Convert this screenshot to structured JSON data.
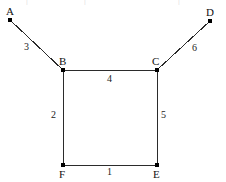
{
  "figure": {
    "width": 226,
    "height": 182,
    "background_color": "#ffffff",
    "stroke_color": "#2b2b2b",
    "node_color": "#000000",
    "label_color": "#111111"
  },
  "artifacts": {
    "top_row_marks": [
      "|",
      "|",
      "|"
    ]
  },
  "chart_data": {
    "type": "diagram",
    "subtype": "node-link-graph",
    "directed": false,
    "weighted": true,
    "nodes": [
      {
        "id": "A",
        "label": "A",
        "x": 10,
        "y": 20,
        "label_x": 6,
        "label_y": 6,
        "degree": 1
      },
      {
        "id": "B",
        "label": "B",
        "x": 63,
        "y": 70,
        "label_x": 59,
        "label_y": 56,
        "degree": 3
      },
      {
        "id": "C",
        "label": "C",
        "x": 157,
        "y": 70,
        "label_x": 152,
        "label_y": 56,
        "degree": 3
      },
      {
        "id": "D",
        "label": "D",
        "x": 210,
        "y": 21,
        "label_x": 206,
        "label_y": 7,
        "degree": 1
      },
      {
        "id": "E",
        "label": "E",
        "x": 157,
        "y": 165,
        "label_x": 153,
        "label_y": 169,
        "degree": 2
      },
      {
        "id": "F",
        "label": "F",
        "x": 63,
        "y": 165,
        "label_x": 59,
        "label_y": 169,
        "degree": 2
      }
    ],
    "edges": [
      {
        "id": "AB",
        "source": "A",
        "target": "B",
        "weight": 3,
        "label": "3",
        "label_x": 24,
        "label_y": 42
      },
      {
        "id": "BC",
        "source": "B",
        "target": "C",
        "weight": 4,
        "label": "4",
        "label_x": 107,
        "label_y": 74
      },
      {
        "id": "CD",
        "source": "C",
        "target": "D",
        "weight": 6,
        "label": "6",
        "label_x": 192,
        "label_y": 43
      },
      {
        "id": "BF",
        "source": "B",
        "target": "F",
        "weight": 2,
        "label": "2",
        "label_x": 51,
        "label_y": 110
      },
      {
        "id": "CE",
        "source": "C",
        "target": "E",
        "weight": 5,
        "label": "5",
        "label_x": 161,
        "label_y": 110
      },
      {
        "id": "FE",
        "source": "F",
        "target": "E",
        "weight": 1,
        "label": "1",
        "label_x": 107,
        "label_y": 167
      }
    ],
    "xlabel": "",
    "ylabel": "",
    "legend": [],
    "grid": false
  }
}
